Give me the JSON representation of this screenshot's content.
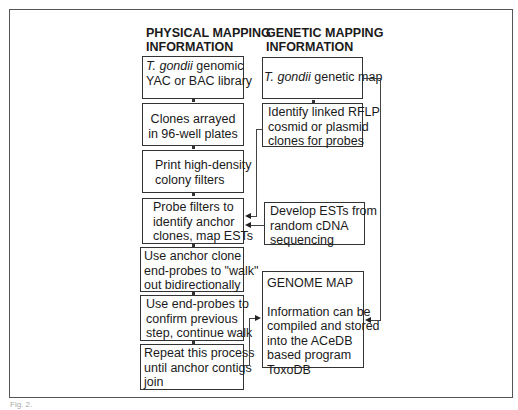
{
  "headings": {
    "physical": "PHYSICAL MAPPING\nINFORMATION",
    "genetic": "GENETIC MAPPING\nINFORMATION"
  },
  "physical_steps": [
    {
      "italic": "T. gondii",
      "lines": [
        " genomic",
        "YAC or BAC library"
      ]
    },
    {
      "lines": [
        "Clones arrayed",
        "in 96-well plates"
      ]
    },
    {
      "lines": [
        "Print high-density",
        "colony filters"
      ]
    },
    {
      "lines": [
        "Probe filters to",
        "identify anchor",
        "clones, map ESTs"
      ]
    },
    {
      "lines": [
        "Use anchor clone",
        "end-probes to \"walk\"",
        "out bidirectionally"
      ]
    },
    {
      "lines": [
        "Use end-probes to",
        "confirm previous",
        "step, continue walk"
      ]
    },
    {
      "lines": [
        "Repeat this process",
        "until anchor contigs",
        "join"
      ]
    }
  ],
  "genetic_steps": [
    {
      "italic": "T. gondii",
      "lines": [
        " genetic map"
      ]
    },
    {
      "lines": [
        "Identify linked RFLP",
        "cosmid or plasmid",
        "clones for probes"
      ]
    },
    {
      "lines": [
        "Develop ESTs from",
        "random cDNA",
        "sequencing"
      ]
    }
  ],
  "genome_map": {
    "title": "GENOME MAP",
    "lines": [
      "Information can be",
      "compiled and stored",
      "into the ACeDB",
      "based program",
      "ToxoDB"
    ]
  },
  "caption": "Fig. 2."
}
